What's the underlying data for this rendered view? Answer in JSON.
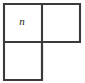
{
  "figure": {
    "kind": "geometric-figure",
    "name": "L-shaped tromino",
    "background_color": "#ffffff",
    "stroke_color": "#3b3b3b",
    "fill_color": "#ffffff",
    "stroke_width": 2.1,
    "square_size": 38,
    "origin": {
      "x": 4,
      "y": 4
    },
    "cells": [
      {
        "id": "cell-top-left",
        "name": "top-left-square",
        "row": 0,
        "col": 0,
        "x": 4,
        "y": 4,
        "width": 38,
        "height": 38,
        "label": "n",
        "label_style": "italic",
        "label_x": 22,
        "label_y": 21
      },
      {
        "id": "cell-top-right",
        "name": "top-right-square",
        "row": 0,
        "col": 1,
        "x": 42,
        "y": 4,
        "width": 38,
        "height": 38,
        "label": "",
        "label_style": "italic",
        "label_x": 61,
        "label_y": 21
      },
      {
        "id": "cell-bottom-left",
        "name": "bottom-left-square",
        "row": 1,
        "col": 0,
        "x": 4,
        "y": 42,
        "width": 38,
        "height": 38,
        "label": "",
        "label_style": "italic",
        "label_x": 22,
        "label_y": 59
      }
    ],
    "outline_path": "M 4 4 L 80 4 L 80 42 L 42 42 L 42 80 L 4 80 Z",
    "dividers": [
      {
        "id": "divider-vertical",
        "name": "vertical-divider",
        "x1": 42,
        "y1": 4,
        "x2": 42,
        "y2": 80
      },
      {
        "id": "divider-horizontal",
        "name": "horizontal-divider",
        "x1": 4,
        "y1": 42,
        "x2": 80,
        "y2": 42
      }
    ],
    "labels": [
      {
        "id": "label-n",
        "text": "n",
        "x": 22,
        "y": 21
      }
    ]
  }
}
